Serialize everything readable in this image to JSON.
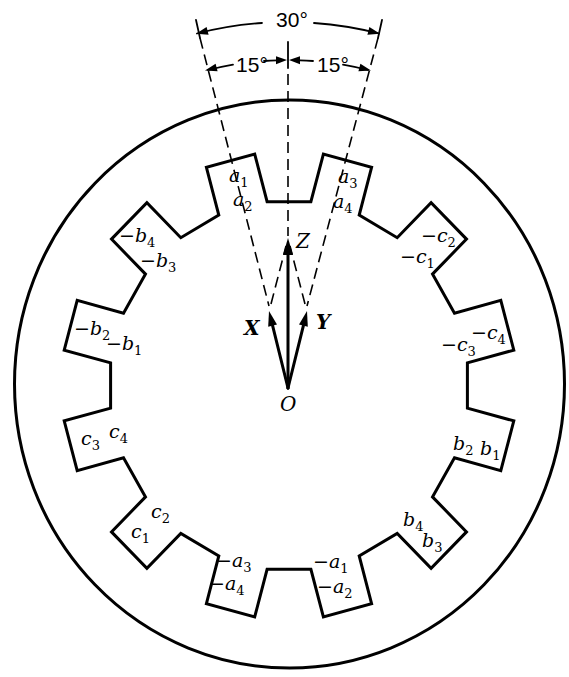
{
  "diagram": {
    "background": "#ffffff",
    "stroke_color": "#000000"
  },
  "angles": {
    "total": "30°",
    "left": "15°",
    "right": "15°"
  },
  "phasors": {
    "origin": "O",
    "x": "X",
    "y": "Y",
    "z": "Z"
  },
  "slots": [
    {
      "labels": [
        {
          "text": "a",
          "sub": "3"
        },
        {
          "text": "a",
          "sub": "4"
        }
      ]
    },
    {
      "labels": [
        {
          "text": "−c",
          "sub": "2"
        },
        {
          "text": "−c",
          "sub": "1"
        }
      ]
    },
    {
      "labels": [
        {
          "text": "−c",
          "sub": "3"
        },
        {
          "text": "−c",
          "sub": "4"
        }
      ]
    },
    {
      "labels": [
        {
          "text": "b",
          "sub": "2"
        },
        {
          "text": "b",
          "sub": "1"
        }
      ]
    },
    {
      "labels": [
        {
          "text": "b",
          "sub": "4"
        },
        {
          "text": "b",
          "sub": "3"
        }
      ]
    },
    {
      "labels": [
        {
          "text": "−a",
          "sub": "1"
        },
        {
          "text": "−a",
          "sub": "2"
        }
      ]
    },
    {
      "labels": [
        {
          "text": "−a",
          "sub": "3"
        },
        {
          "text": "−a",
          "sub": "4"
        }
      ]
    },
    {
      "labels": [
        {
          "text": "c",
          "sub": "2"
        },
        {
          "text": "c",
          "sub": "1"
        }
      ]
    },
    {
      "labels": [
        {
          "text": "c",
          "sub": "3"
        },
        {
          "text": "c",
          "sub": "4"
        }
      ]
    },
    {
      "labels": [
        {
          "text": "−b",
          "sub": "2"
        },
        {
          "text": "−b",
          "sub": "1"
        }
      ]
    },
    {
      "labels": [
        {
          "text": "−b",
          "sub": "4"
        },
        {
          "text": "−b",
          "sub": "3"
        }
      ]
    },
    {
      "labels": [
        {
          "text": "a",
          "sub": "1"
        },
        {
          "text": "a",
          "sub": "2"
        }
      ]
    }
  ]
}
